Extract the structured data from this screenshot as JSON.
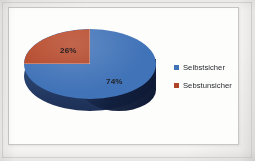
{
  "chart_data": {
    "type": "pie",
    "title": "",
    "subtitle": "",
    "xlabel": "",
    "ylabel": "",
    "categories": [
      "Selbstsicher",
      "Sebstunsicher"
    ],
    "values": [
      74,
      26
    ],
    "data_labels": [
      "74%",
      "26%"
    ],
    "colors": [
      "#4173b8",
      "#ae4328"
    ],
    "legend_position": "right",
    "grid": false,
    "three_d": true,
    "slices": [
      {
        "label": "Selbstsicher",
        "value": 74,
        "data_label": "74%",
        "color": "#4173b8"
      },
      {
        "label": "Sebstunsicher",
        "value": 26,
        "data_label": "26%",
        "color": "#ae4328"
      }
    ]
  },
  "legend": {
    "items": [
      {
        "label": "Selbstsicher",
        "color": "#4173b8",
        "swatch_name": "legend-swatch-selbstsicher"
      },
      {
        "label": "Sebstunsicher",
        "color": "#ae4328",
        "swatch_name": "legend-swatch-sebstunsicher"
      }
    ]
  },
  "labels": {
    "blue_pct": "74%",
    "red_pct": "26%"
  },
  "colors": {
    "pie_blue_top": "#4173b8",
    "pie_blue_side": "#2b4672",
    "pie_blue_side_dark": "#1d2f55",
    "pie_red_top": "#ae4328",
    "chart_background": "#fdfdfc",
    "paper_background": "#f4f3f1",
    "frame_border": "#c9c7c3",
    "label_text": "#231f20"
  }
}
